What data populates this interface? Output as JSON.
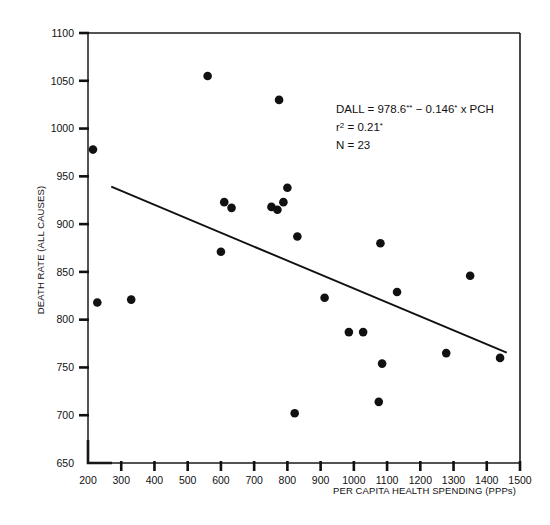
{
  "chart_data": {
    "type": "scatter",
    "title": "",
    "xlabel": "PER CAPITA HEALTH SPENDING (PPPs)",
    "ylabel": "DEATH RATE (ALL CAUSES)",
    "xlim": [
      200,
      1500
    ],
    "ylim": [
      650,
      1100
    ],
    "xticks": [
      200,
      300,
      400,
      500,
      600,
      700,
      800,
      900,
      1000,
      1100,
      1200,
      1300,
      1400,
      1500
    ],
    "yticks": [
      650,
      700,
      750,
      800,
      850,
      900,
      950,
      1000,
      1050,
      1100
    ],
    "grid": false,
    "legend": null,
    "points": [
      {
        "x": 215,
        "y": 978
      },
      {
        "x": 228,
        "y": 818
      },
      {
        "x": 330,
        "y": 821
      },
      {
        "x": 560,
        "y": 1055
      },
      {
        "x": 600,
        "y": 871
      },
      {
        "x": 610,
        "y": 923
      },
      {
        "x": 632,
        "y": 917
      },
      {
        "x": 752,
        "y": 918
      },
      {
        "x": 770,
        "y": 915
      },
      {
        "x": 775,
        "y": 1030
      },
      {
        "x": 788,
        "y": 923
      },
      {
        "x": 800,
        "y": 938
      },
      {
        "x": 822,
        "y": 702
      },
      {
        "x": 830,
        "y": 887
      },
      {
        "x": 912,
        "y": 823
      },
      {
        "x": 985,
        "y": 787
      },
      {
        "x": 1028,
        "y": 787
      },
      {
        "x": 1075,
        "y": 714
      },
      {
        "x": 1080,
        "y": 880
      },
      {
        "x": 1085,
        "y": 754
      },
      {
        "x": 1130,
        "y": 829
      },
      {
        "x": 1278,
        "y": 765
      },
      {
        "x": 1350,
        "y": 846
      },
      {
        "x": 1440,
        "y": 760
      }
    ],
    "fit_line": {
      "intercept": 978.6,
      "slope": -0.146,
      "x_start": 270,
      "x_end": 1460
    },
    "annotation": {
      "equation_prefix": "DALL = 978.6",
      "equation_star1": "**",
      "equation_middle": " − 0.146",
      "equation_star2": "*",
      "equation_suffix": " x PCH",
      "r2_label": "r",
      "r2_sup": "2",
      "r2_value": " = 0.21",
      "r2_star": "*",
      "n_text": "N = 23"
    }
  },
  "colors": {
    "axis": "#111111",
    "point": "#111111",
    "line": "#111111",
    "background": "#ffffff"
  }
}
